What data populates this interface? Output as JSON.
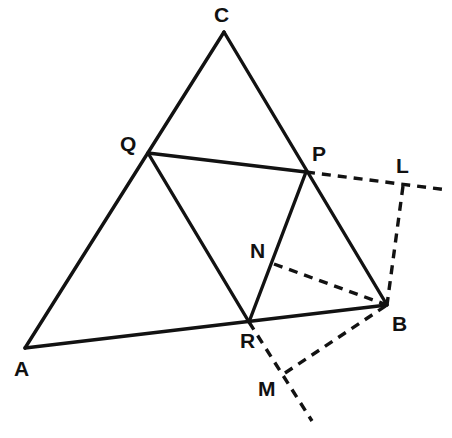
{
  "figure": {
    "background_color": "#ffffff",
    "stroke_color": "#121212",
    "canvas": {
      "width": 452,
      "height": 438
    }
  },
  "points": {
    "A": {
      "label": "A",
      "x": 25,
      "y": 348,
      "label_x": 14,
      "label_y": 358
    },
    "B": {
      "label": "B",
      "x": 387,
      "y": 305,
      "label_x": 392,
      "label_y": 313
    },
    "C": {
      "label": "C",
      "x": 224,
      "y": 32,
      "label_x": 214,
      "label_y": 4
    },
    "P": {
      "label": "P",
      "x": 306,
      "y": 172,
      "label_x": 312,
      "label_y": 143
    },
    "Q": {
      "label": "Q",
      "x": 148,
      "y": 153,
      "label_x": 120,
      "label_y": 133
    },
    "R": {
      "label": "R",
      "x": 249,
      "y": 322,
      "label_x": 240,
      "label_y": 330
    },
    "N": {
      "label": "N",
      "x": 274,
      "y": 264,
      "label_x": 250,
      "label_y": 240
    },
    "L": {
      "label": "L",
      "x": 403,
      "y": 186,
      "label_x": 396,
      "label_y": 155
    },
    "M": {
      "label": "M",
      "x": 285,
      "y": 373,
      "label_x": 258,
      "label_y": 378
    }
  },
  "solid_edges": [
    {
      "name": "edge-A-C",
      "from": "A",
      "to": "C",
      "note": "left side of triangle, passes through Q"
    },
    {
      "name": "edge-C-B",
      "from": "C",
      "to": "B",
      "note": "right side of triangle, passes through P"
    },
    {
      "name": "edge-A-B",
      "from": "A",
      "to": "B",
      "note": "base of triangle, passes through R"
    },
    {
      "name": "edge-Q-P",
      "from": "Q",
      "to": "P",
      "note": "midline segment"
    },
    {
      "name": "edge-Q-R",
      "from": "Q",
      "to": "R",
      "note": "midline segment"
    },
    {
      "name": "edge-P-R",
      "from": "P",
      "to": "R",
      "note": "midline segment, passes through N"
    }
  ],
  "dashed_edges": [
    {
      "name": "dashed-P-L-extension",
      "from_x": 306,
      "from_y": 172,
      "to_x": 448,
      "to_y": 190,
      "note": "ray from P through L extending off to the right"
    },
    {
      "name": "dashed-L-B",
      "from_x": 403,
      "from_y": 186,
      "to_x": 387,
      "to_y": 305,
      "note": "vertical dashed segment from L down to B"
    },
    {
      "name": "dashed-N-B",
      "from_x": 274,
      "from_y": 264,
      "to_x": 387,
      "to_y": 305,
      "note": "dashed segment from N to B"
    },
    {
      "name": "dashed-R-M-extension",
      "from_x": 249,
      "from_y": 322,
      "to_x": 312,
      "to_y": 421,
      "note": "ray from R through M extending down-right"
    },
    {
      "name": "dashed-M-B",
      "from_x": 285,
      "from_y": 373,
      "to_x": 387,
      "to_y": 305,
      "note": "dashed segment from M up to B"
    }
  ],
  "labels_order": [
    "C",
    "Q",
    "P",
    "L",
    "N",
    "A",
    "R",
    "B",
    "M"
  ]
}
